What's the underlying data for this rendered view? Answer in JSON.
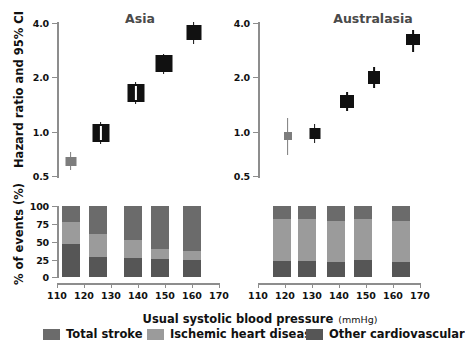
{
  "figure": {
    "yaxis_caption_top": "Hazard ratio and 95% CI",
    "yaxis_caption_bottom": "% of events (%)",
    "xaxis_caption": "Usual systolic blood pressure",
    "xaxis_caption_units": "(mmHg)"
  },
  "legend": {
    "items": [
      {
        "label": "Total stroke",
        "color": "#6b6b6b"
      },
      {
        "label": "Ischemic heart disease",
        "color": "#9b9b9b"
      },
      {
        "label": "Other cardiovascular",
        "color": "#565656"
      }
    ]
  },
  "chart_data": [
    {
      "type": "scatter",
      "title": "Asia",
      "panel": "top-left",
      "xlabel": "Usual systolic blood pressure (mmHg)",
      "ylabel": "Hazard ratio and 95% CI",
      "yscale": "log",
      "ylim": [
        0.5,
        4.0
      ],
      "yticks": [
        0.5,
        1.0,
        2.0,
        4.0
      ],
      "ytick_labels": [
        "0.5",
        "1.0",
        "2.0",
        "4.0"
      ],
      "xlim": [
        110,
        170
      ],
      "xticks": [
        110,
        120,
        130,
        140,
        150,
        160,
        170
      ],
      "xtick_labels": [
        "110",
        "120",
        "130",
        "140",
        "150",
        "160",
        "170"
      ],
      "grid": false,
      "x": [
        115,
        125,
        138,
        148,
        160
      ],
      "values": [
        0.65,
        1.0,
        1.72,
        2.4,
        3.7
      ],
      "ci_low": [
        0.61,
        0.93,
        1.6,
        2.3,
        3.45
      ],
      "ci_high": [
        0.7,
        1.08,
        1.85,
        2.52,
        3.95
      ],
      "reference_index": 1,
      "annotations": [
        "Reference point at 125 mmHg shown in gray"
      ]
    },
    {
      "type": "scatter",
      "title": "Australasia",
      "panel": "top-right",
      "xlabel": "Usual systolic blood pressure (mmHg)",
      "ylabel": "Hazard ratio and 95% CI",
      "yscale": "log",
      "ylim": [
        0.5,
        4.0
      ],
      "yticks": [
        0.5,
        1.0,
        2.0,
        4.0
      ],
      "ytick_labels": [
        "0.5",
        "1.0",
        "2.0",
        "4.0"
      ],
      "xlim": [
        110,
        170
      ],
      "xticks": [
        110,
        120,
        130,
        140,
        150,
        160,
        170
      ],
      "xtick_labels": [
        "110",
        "120",
        "130",
        "140",
        "150",
        "160",
        "170"
      ],
      "grid": false,
      "x": [
        119,
        128,
        139,
        149,
        163
      ],
      "values": [
        0.95,
        1.0,
        1.5,
        2.05,
        3.2
      ],
      "ci_low": [
        0.72,
        0.93,
        1.4,
        1.9,
        2.85
      ],
      "ci_high": [
        1.22,
        1.08,
        1.62,
        2.2,
        3.55
      ],
      "reference_index": 0,
      "annotations": [
        "Leftmost point at 119 mmHg shown in gray with wide CI"
      ]
    },
    {
      "type": "bar",
      "title": "",
      "panel": "bottom-left",
      "stacked": true,
      "xlabel": "Usual systolic blood pressure (mmHg)",
      "ylabel": "% of events (%)",
      "ylim": [
        0,
        100
      ],
      "yticks": [
        0,
        25,
        50,
        75,
        100
      ],
      "ytick_labels": [
        "0",
        "25",
        "50",
        "75",
        "100"
      ],
      "xlim": [
        110,
        170
      ],
      "xticks": [
        110,
        120,
        130,
        140,
        150,
        160,
        170
      ],
      "xtick_labels": [
        "110",
        "120",
        "130",
        "140",
        "150",
        "160",
        "170"
      ],
      "grid": false,
      "categories": [
        115,
        125,
        138,
        148,
        160
      ],
      "series": [
        {
          "name": "Other cardiovascular",
          "color": "#565656",
          "values": [
            47,
            28,
            27,
            25,
            24
          ]
        },
        {
          "name": "Ischemic heart disease",
          "color": "#9b9b9b",
          "values": [
            31,
            32,
            25,
            14,
            12
          ]
        },
        {
          "name": "Total stroke",
          "color": "#6b6b6b",
          "values": [
            22,
            40,
            48,
            61,
            64
          ]
        }
      ]
    },
    {
      "type": "bar",
      "title": "",
      "panel": "bottom-right",
      "stacked": true,
      "xlabel": "Usual systolic blood pressure (mmHg)",
      "ylabel": "% of events (%)",
      "ylim": [
        0,
        100
      ],
      "yticks": [
        0,
        25,
        50,
        75,
        100
      ],
      "ytick_labels": [
        "0",
        "25",
        "50",
        "75",
        "100"
      ],
      "xlim": [
        110,
        170
      ],
      "xticks": [
        110,
        120,
        130,
        140,
        150,
        160,
        170
      ],
      "xtick_labels": [
        "110",
        "120",
        "130",
        "140",
        "150",
        "160",
        "170"
      ],
      "grid": false,
      "categories": [
        119,
        128,
        139,
        149,
        163
      ],
      "series": [
        {
          "name": "Other cardiovascular",
          "color": "#565656",
          "values": [
            22,
            22,
            21,
            24,
            21
          ]
        },
        {
          "name": "Ischemic heart disease",
          "color": "#9b9b9b",
          "values": [
            60,
            59,
            58,
            57,
            58
          ]
        },
        {
          "name": "Total stroke",
          "color": "#6b6b6b",
          "values": [
            18,
            19,
            21,
            19,
            21
          ]
        }
      ]
    }
  ],
  "axes": {
    "top_left": {
      "ytick_labels": [
        "4.0",
        "2.0",
        "1.0",
        "0.5"
      ]
    },
    "top_right": {
      "ytick_labels": [
        "4.0",
        "2.0",
        "1.0",
        "0.5"
      ]
    },
    "bottom_left": {
      "ytick_labels": [
        "100",
        "75",
        "50",
        "25",
        "0"
      ],
      "xtick_labels": [
        "110",
        "120",
        "130",
        "140",
        "150",
        "160",
        "170"
      ]
    },
    "bottom_right": {
      "xtick_labels": [
        "110",
        "120",
        "130",
        "140",
        "150",
        "160",
        "170"
      ]
    }
  }
}
